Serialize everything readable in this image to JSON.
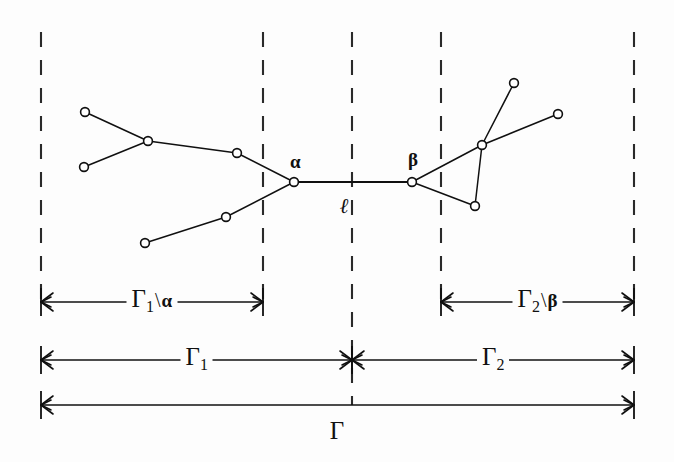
{
  "figure": {
    "background_color": "#fdfdfd",
    "ink_color": "#101010"
  },
  "labels": {
    "alpha": "α",
    "beta": "β",
    "edge_length": "ℓ",
    "gamma": "Γ",
    "gamma_sub1": "1",
    "gamma_sub2": "2",
    "backslash": "\\"
  },
  "spans": [
    {
      "name": "gamma1-minus-alpha",
      "label_gamma": "Γ",
      "label_sub": "1",
      "label_sep": "\\",
      "label_tail": "α",
      "x_start": 41,
      "x_end": 263,
      "y": 302
    },
    {
      "name": "gamma2-minus-beta",
      "label_gamma": "Γ",
      "label_sub": "2",
      "label_sep": "\\",
      "label_tail": "β",
      "x_start": 441,
      "x_end": 634,
      "y": 302
    },
    {
      "name": "gamma1",
      "label_gamma": "Γ",
      "label_sub": "1",
      "label_sep": "",
      "label_tail": "",
      "x_start": 41,
      "x_end": 352,
      "y": 360
    },
    {
      "name": "gamma2",
      "label_gamma": "Γ",
      "label_sub": "2",
      "label_sep": "",
      "label_tail": "",
      "x_start": 352,
      "x_end": 634,
      "y": 360
    },
    {
      "name": "gamma-total",
      "label_gamma": "Γ",
      "label_sub": "",
      "label_sep": "",
      "label_tail": "",
      "x_start": 41,
      "x_end": 634,
      "y": 405
    }
  ],
  "guides": {
    "name": "vertical-dashed-guides",
    "x_positions": [
      41,
      263,
      352,
      441,
      634
    ],
    "y_top": 32,
    "y_bottom": 300,
    "center_extra_bottom": 405
  },
  "graph": {
    "nodes": [
      {
        "id": "L1",
        "x": 85,
        "y": 112,
        "side": "left",
        "kind": "leaf"
      },
      {
        "id": "L2",
        "x": 84,
        "y": 167,
        "side": "left",
        "kind": "leaf"
      },
      {
        "id": "L3",
        "x": 148,
        "y": 141,
        "side": "left",
        "kind": "branch"
      },
      {
        "id": "L4",
        "x": 237,
        "y": 153,
        "side": "left",
        "kind": "branch"
      },
      {
        "id": "L5",
        "x": 145,
        "y": 243,
        "side": "left",
        "kind": "leaf"
      },
      {
        "id": "L6",
        "x": 226,
        "y": 217,
        "side": "left",
        "kind": "branch"
      },
      {
        "id": "A",
        "x": 294,
        "y": 182,
        "side": "left",
        "kind": "alpha"
      },
      {
        "id": "B",
        "x": 412,
        "y": 182,
        "side": "right",
        "kind": "beta"
      },
      {
        "id": "R1",
        "x": 482,
        "y": 145,
        "side": "right",
        "kind": "branch"
      },
      {
        "id": "R2",
        "x": 475,
        "y": 206,
        "side": "right",
        "kind": "branch"
      },
      {
        "id": "R3",
        "x": 514,
        "y": 83,
        "side": "right",
        "kind": "leaf"
      },
      {
        "id": "R4",
        "x": 558,
        "y": 114,
        "side": "right",
        "kind": "leaf"
      }
    ],
    "edges": [
      {
        "from": "L1",
        "to": "L3",
        "type": "tree"
      },
      {
        "from": "L2",
        "to": "L3",
        "type": "tree"
      },
      {
        "from": "L3",
        "to": "L4",
        "type": "tree"
      },
      {
        "from": "L4",
        "to": "A",
        "type": "tree"
      },
      {
        "from": "L5",
        "to": "L6",
        "type": "tree"
      },
      {
        "from": "L6",
        "to": "A",
        "type": "tree"
      },
      {
        "from": "A",
        "to": "B",
        "type": "bridge"
      },
      {
        "from": "B",
        "to": "R1",
        "type": "tree"
      },
      {
        "from": "B",
        "to": "R2",
        "type": "tree"
      },
      {
        "from": "R1",
        "to": "R2",
        "type": "tree"
      },
      {
        "from": "R1",
        "to": "R3",
        "type": "tree"
      },
      {
        "from": "R1",
        "to": "R4",
        "type": "tree"
      }
    ]
  },
  "annotations": {
    "alpha_label_pos": {
      "x": 290,
      "y": 152
    },
    "beta_label_pos": {
      "x": 408,
      "y": 150
    },
    "ell_label_pos": {
      "x": 340,
      "y": 196
    },
    "gamma_total_label_pos": {
      "x": 337,
      "y": 418
    }
  }
}
